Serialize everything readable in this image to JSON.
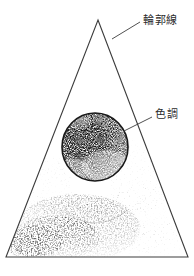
{
  "figure": {
    "type": "technical-illustration",
    "background_color": "#ffffff",
    "ink_color": "#2b2b2b",
    "stipple_color": "#3a3a3a"
  },
  "triangle": {
    "name": "outline-triangle",
    "apex": {
      "x": 98,
      "y": 20
    },
    "bottom_left": {
      "x": 6,
      "y": 257
    },
    "bottom_right": {
      "x": 188,
      "y": 257
    },
    "stroke_width": 1,
    "stroke_color": "#3c3c3c"
  },
  "cylinder": {
    "name": "shaded-cylinder",
    "top_ellipse": {
      "cx": 95,
      "cy": 147,
      "rx": 33,
      "ry": 34
    },
    "body": {
      "left": 62,
      "right": 128,
      "top": 147,
      "bottom": 228
    },
    "outline_color": "#1c1c1c",
    "fill": "stipple-dark"
  },
  "ground_shadow": {
    "name": "cast-shadow",
    "description": "stipple shading spreading left and down from cylinder base toward triangle floor"
  },
  "labels": [
    {
      "id": "contour",
      "text": "輪郭線",
      "reading": "rinkakusen",
      "meaning": "contour line",
      "text_position": {
        "x": 143,
        "y": 15
      },
      "leader": {
        "x1": 140,
        "y1": 22,
        "x2": 112,
        "y2": 39
      }
    },
    {
      "id": "tone",
      "text": "色調",
      "reading": "shikicho",
      "meaning": "tone",
      "text_position": {
        "x": 155,
        "y": 109
      },
      "leader": {
        "x1": 152,
        "y1": 117,
        "x2": 124,
        "y2": 131
      }
    }
  ]
}
